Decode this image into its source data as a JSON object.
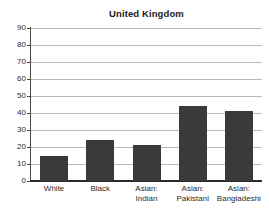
{
  "chart_data": {
    "type": "bar",
    "title": "United Kingdom",
    "xlabel": "",
    "ylabel": "",
    "ylim": [
      0,
      90
    ],
    "ytick_step": 10,
    "yticks": [
      90,
      80,
      70,
      60,
      50,
      40,
      30,
      20,
      10,
      0
    ],
    "grid": true,
    "legend": false,
    "categories": [
      "White",
      "Black",
      "Asian: Indian",
      "Asian: Pakistani",
      "Asian: Bangladeshi"
    ],
    "category_lines": [
      {
        "line1": "White",
        "line2": ""
      },
      {
        "line1": "Black",
        "line2": ""
      },
      {
        "line1": "Asian:",
        "line2": "Indian"
      },
      {
        "line1": "Asian:",
        "line2": "Pakistani"
      },
      {
        "line1": "Asian:",
        "line2": "Bangladeshi"
      }
    ],
    "values": [
      15,
      24,
      21,
      44,
      41
    ],
    "bar_color": "#3a3a3a",
    "grid_color": "#b9b9b9",
    "axis_color": "#2b2b2b",
    "background": "#ffffff"
  }
}
